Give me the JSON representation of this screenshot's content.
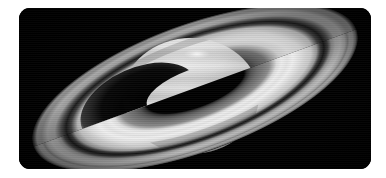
{
  "image": {
    "title": "Saturn",
    "subject": "Saturn with ring system",
    "rendering": "grayscale astronomical photograph",
    "alt_text": "Grayscale telescope image of the planet Saturn, tilted rings spanning the frame, planet shadow cast on the rings",
    "background_color": "#ffffff",
    "panel_color": "#000000",
    "panel": {
      "x": 19,
      "y": 8,
      "width": 352,
      "height": 161,
      "corner_radius": 11
    }
  },
  "scene": {
    "ring_tilt_degrees": -20,
    "ring_center": {
      "x": 176,
      "y": 80
    },
    "ring_outer_semi_major": 172,
    "ring_outer_semi_minor": 64,
    "globe": {
      "center_x": 172,
      "center_y": 88,
      "radius_x": 68,
      "radius_y": 58,
      "oblateness": "0.85"
    },
    "features": [
      {
        "name": "a-ring",
        "label": "A Ring",
        "brightness": "#b9b9b9"
      },
      {
        "name": "cassini-division",
        "label": "Cassini Division",
        "brightness": "#1a1a1a"
      },
      {
        "name": "b-ring",
        "label": "B Ring",
        "brightness": "#e8e8e8"
      },
      {
        "name": "c-ring",
        "label": "C Ring",
        "brightness": "#6e6e6e"
      },
      {
        "name": "encke-gap",
        "label": "Encke Gap",
        "brightness": "#8a8a8a"
      },
      {
        "name": "planet-shadow",
        "label": "Planet Shadow on Rings",
        "brightness": "#050505"
      },
      {
        "name": "polar-spot",
        "label": "Bright Polar Feature",
        "brightness": "#f2f2f2"
      },
      {
        "name": "cloud-bands",
        "label": "Atmospheric Cloud Bands",
        "brightness": "#cfcfcf"
      }
    ]
  },
  "chart_data": {
    "type": "scatter",
    "xlabel": "",
    "ylabel": "",
    "categories": [
      "A Ring",
      "Cassini Division",
      "B Ring",
      "C Ring",
      "Globe",
      "Shadow"
    ],
    "values": [
      72,
      10,
      91,
      43,
      82,
      2
    ],
    "annotations": [
      "Rings inclined approximately 20 degrees",
      "Northern hemisphere tilted toward viewer",
      "Planet shadow visible on far rings at lower left"
    ]
  },
  "palette": {
    "sky": "#000000",
    "ring_bright": "#ececec",
    "ring_mid": "#b4b4b4",
    "ring_dim": "#6a6a6a",
    "ring_gap": "#141414",
    "globe_bright": "#e2e2e2",
    "globe_mid": "#c4c4c4",
    "globe_shadow": "#7d7d7d",
    "frame": "#ffffff"
  }
}
